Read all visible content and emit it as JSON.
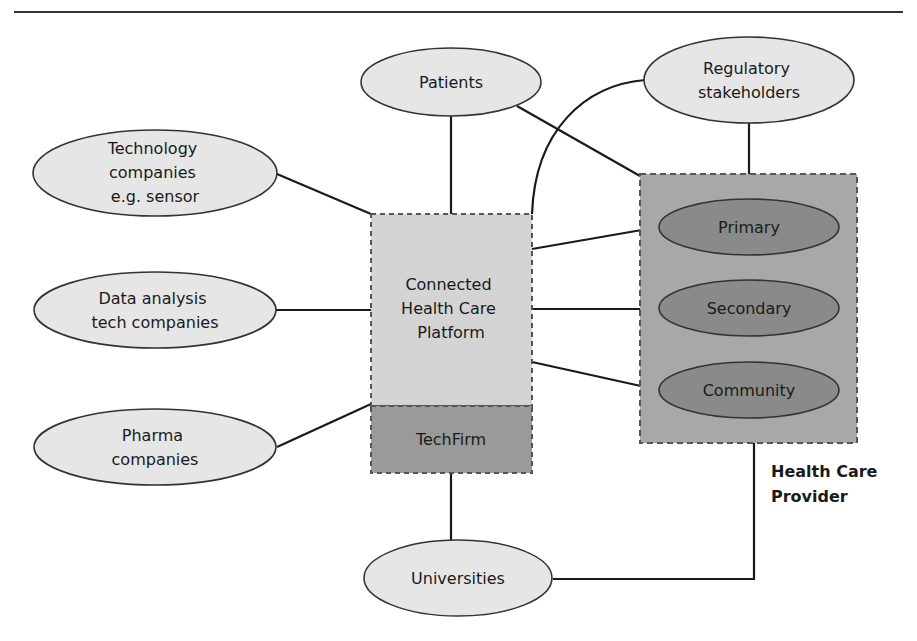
{
  "diagram": {
    "colors": {
      "ellipse_light": "#e6e6e6",
      "ellipse_dark": "#8a8a8a",
      "platform_fill": "#d4d4d4",
      "techfirm_fill": "#9a9a9a",
      "provider_fill": "#a8a8a8",
      "line": "#1a1a1a",
      "dashed_border": "#555555"
    },
    "nodes": {
      "patients": {
        "lines": [
          "Patients"
        ]
      },
      "regulatory": {
        "lines": [
          "Regulatory",
          "stakeholders"
        ]
      },
      "technology": {
        "lines": [
          "Technology",
          "companies",
          "e.g. sensor"
        ]
      },
      "data_analysis": {
        "lines": [
          "Data analysis",
          "tech companies"
        ]
      },
      "pharma": {
        "lines": [
          "Pharma",
          "companies"
        ]
      },
      "universities": {
        "lines": [
          "Universities"
        ]
      },
      "platform": {
        "lines": [
          "Connected",
          "Health Care",
          "Platform"
        ]
      },
      "techfirm": {
        "lines": [
          "TechFirm"
        ]
      },
      "primary": {
        "lines": [
          "Primary"
        ]
      },
      "secondary": {
        "lines": [
          "Secondary"
        ]
      },
      "community": {
        "lines": [
          "Community"
        ]
      },
      "provider_label": {
        "lines": [
          "Health Care",
          "Provider"
        ]
      }
    },
    "edges": [
      {
        "from": "Patients",
        "to": "Connected Health Care Platform"
      },
      {
        "from": "Patients",
        "to": "Health Care Provider"
      },
      {
        "from": "Regulatory stakeholders",
        "to": "Health Care Provider"
      },
      {
        "from": "Regulatory stakeholders",
        "to": "Connected Health Care Platform"
      },
      {
        "from": "Technology companies e.g. sensor",
        "to": "Connected Health Care Platform"
      },
      {
        "from": "Data analysis tech companies",
        "to": "Connected Health Care Platform"
      },
      {
        "from": "Pharma companies",
        "to": "Connected Health Care Platform"
      },
      {
        "from": "Connected Health Care Platform",
        "to": "Primary"
      },
      {
        "from": "Connected Health Care Platform",
        "to": "Secondary"
      },
      {
        "from": "Connected Health Care Platform",
        "to": "Community"
      },
      {
        "from": "TechFirm",
        "to": "Universities"
      },
      {
        "from": "Universities",
        "to": "Health Care Provider"
      }
    ]
  }
}
